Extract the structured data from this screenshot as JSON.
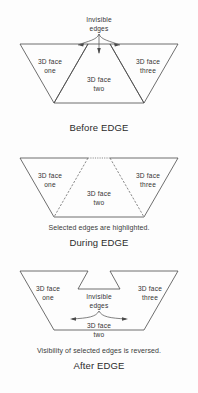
{
  "figure": {
    "background_color": "#fdfdfd",
    "line_color": "#4a4a4a",
    "highlight_color": "#8a8a8a"
  },
  "panels": [
    {
      "id": "before",
      "caption": "Before EDGE",
      "note": "",
      "annotation": {
        "line1": "Invisible",
        "line2": "edges"
      },
      "faces": [
        {
          "name": "face-one",
          "line1": "3D face",
          "line2": "one"
        },
        {
          "name": "face-two",
          "line1": "3D face",
          "line2": "two"
        },
        {
          "name": "face-three",
          "line1": "3D face",
          "line2": "three"
        }
      ]
    },
    {
      "id": "during",
      "caption": "During EDGE",
      "note": "Selected edges are highlighted.",
      "annotation": {
        "line1": "",
        "line2": ""
      },
      "faces": [
        {
          "name": "face-one",
          "line1": "3D face",
          "line2": "one"
        },
        {
          "name": "face-two",
          "line1": "3D face",
          "line2": "two"
        },
        {
          "name": "face-three",
          "line1": "3D face",
          "line2": "three"
        }
      ]
    },
    {
      "id": "after",
      "caption": "After EDGE",
      "note": "Visibility of selected edges is reversed.",
      "annotation": {
        "line1": "Invisible",
        "line2": "edges"
      },
      "faces": [
        {
          "name": "face-one",
          "line1": "3D face",
          "line2": "one"
        },
        {
          "name": "face-two",
          "line1": "3D face",
          "line2": "two"
        },
        {
          "name": "face-three",
          "line1": "3D face",
          "line2": "three"
        }
      ]
    }
  ]
}
